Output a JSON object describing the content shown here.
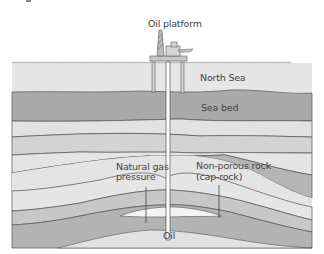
{
  "labels": {
    "platform": "Oil platform",
    "sea": "North Sea",
    "seabed": "Sea bed",
    "gas_line1": "Natural gas",
    "gas_line2": "pressure",
    "caprock_line1": "Non-porous rock",
    "caprock_line2": "(cap-rock)",
    "oil": "Oil"
  },
  "colors": {
    "sea": "#e6e6e6",
    "seabed": "#a9a9a9",
    "light_layer": "#e2e2e2",
    "mid_layer": "#c9c9c9",
    "dark_layer": "#b3b3b3",
    "oil": "#f4f4f4",
    "line": "#555555"
  }
}
